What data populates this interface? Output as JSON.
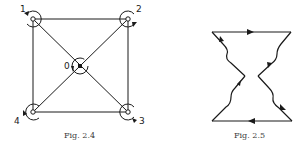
{
  "figures": [
    {
      "id": "fig-2-4",
      "caption": "Fig. 2.4",
      "nodes": [
        {
          "label": "1",
          "x": 33,
          "y": 19
        },
        {
          "label": "2",
          "x": 128,
          "y": 19
        },
        {
          "label": "3",
          "x": 128,
          "y": 112
        },
        {
          "label": "4",
          "x": 33,
          "y": 112
        },
        {
          "label": "0",
          "x": 80,
          "y": 66
        }
      ]
    },
    {
      "id": "fig-2-5",
      "caption": "Fig. 2.5"
    }
  ],
  "colors": {
    "stroke": "#1a1a1a",
    "caption": "#3a3a3a",
    "background": "#ffffff"
  }
}
